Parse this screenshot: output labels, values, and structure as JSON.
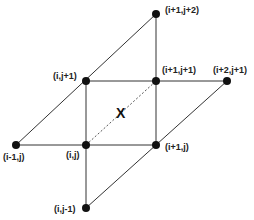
{
  "diagram": {
    "center_label": "X",
    "nodes": [
      {
        "id": "n_i1_j2",
        "label": "(i+1,j+2)"
      },
      {
        "id": "n_i_j1",
        "label": "(i,j+1)"
      },
      {
        "id": "n_i1_j1",
        "label": "(i+1,j+1)"
      },
      {
        "id": "n_i2_j1",
        "label": "(i+2,j+1)"
      },
      {
        "id": "n_im1_j",
        "label": "(i-1,j)"
      },
      {
        "id": "n_i_j",
        "label": "(i,j)"
      },
      {
        "id": "n_i1_j",
        "label": "(i+1,j)"
      },
      {
        "id": "n_i_jm1",
        "label": "(i,j-1)"
      }
    ],
    "line_color": "#333333",
    "node_color": "#111111"
  }
}
